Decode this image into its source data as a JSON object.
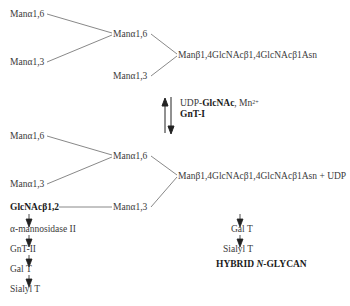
{
  "diagram": {
    "top_structure": {
      "branch_a16_a16": "Manα1,6",
      "branch_a13_upper": "Manα1,3",
      "inner_a16": "Manα1,6",
      "inner_a13": "Manα1,3",
      "core": "Manβ1,4GlcNAcβ1,4GlcNAcβ1Asn"
    },
    "reaction": {
      "substrate_prefix": "UDP-",
      "substrate_bold": "GlcNAc",
      "substrate_suffix": ", Mn",
      "cofactor_charge": "2+",
      "enzyme": "GnT-I"
    },
    "bottom_structure": {
      "branch_a16_a16": "Manα1,6",
      "branch_a13_upper": "Manα1,3",
      "inner_a16": "Manα1,6",
      "inner_a13": "Manα1,3",
      "added_residue": "GlcNAcβ1,2",
      "core": "Manβ1,4GlcNAcβ1,4GlcNAcβ1Asn + UDP"
    },
    "left_pathway": [
      "α-mannosidase II",
      "GnT-II",
      "Gal T",
      "Sialyl T"
    ],
    "right_pathway": [
      "Gal T",
      "Sialyl T"
    ],
    "hybrid_label": {
      "prefix": "HYBRID ",
      "italic": "N",
      "suffix": "-GLYCAN"
    }
  }
}
